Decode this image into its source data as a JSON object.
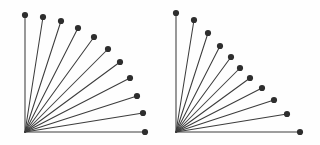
{
  "figure": {
    "background_color": "#fefefe",
    "line_color": "#3c3c3c",
    "dot_color": "#2e2e2e",
    "panel_count": 2,
    "panel_labels": [
      "left-fan",
      "right-fan"
    ]
  },
  "chart_data": {
    "type": "scatter",
    "subtitle": "",
    "xlabel": "",
    "ylabel": "",
    "grid": false,
    "legend": false,
    "axis_ticks": false,
    "tick_labels": [],
    "legend_entries": [],
    "annotations": [],
    "panels": [
      {
        "name": "left-fan",
        "description": "Eleven spokes radiating from a lower-left origin at equal angular spacing of 9 degrees, from 0 to 90 degrees, with nearly uniform radius forming a quarter circle of dots.",
        "origin": {
          "x": 25,
          "y": 132
        },
        "spoke_count": 11,
        "angle_start_deg": 0,
        "angle_end_deg": 90,
        "angle_step_deg": 9,
        "angles_deg": [
          0,
          9,
          18,
          27,
          36,
          45,
          54,
          63,
          72,
          81,
          90
        ],
        "radii": [
          120,
          119,
          118,
          118,
          118,
          118,
          117,
          117,
          117,
          118,
          117
        ],
        "endpoints": [
          {
            "x": 145,
            "y": 132
          },
          {
            "x": 143,
            "y": 113
          },
          {
            "x": 137,
            "y": 96
          },
          {
            "x": 130,
            "y": 78
          },
          {
            "x": 120,
            "y": 62
          },
          {
            "x": 108,
            "y": 49
          },
          {
            "x": 94,
            "y": 37
          },
          {
            "x": 78,
            "y": 28
          },
          {
            "x": 61,
            "y": 21
          },
          {
            "x": 43,
            "y": 17
          },
          {
            "x": 25,
            "y": 15
          }
        ],
        "dot_radius": 3.1
      },
      {
        "name": "right-fan",
        "description": "Eleven spokes radiating from a lower-left origin at equal angular spacing of 9 degrees, from 0 to 90 degrees, with radii that vary, longest at the horizontal and vertical extremes and shortest near the middle of the sweep.",
        "origin": {
          "x": 176,
          "y": 132
        },
        "spoke_count": 11,
        "angle_start_deg": 0,
        "angle_end_deg": 90,
        "angle_step_deg": 9,
        "angles_deg": [
          0,
          9,
          18,
          27,
          36,
          45,
          54,
          63,
          72,
          81,
          90
        ],
        "radii": [
          124,
          112,
          103,
          96,
          92,
          91,
          93,
          97,
          104,
          113,
          119
        ],
        "endpoints": [
          {
            "x": 300,
            "y": 132
          },
          {
            "x": 287,
            "y": 114
          },
          {
            "x": 274,
            "y": 100
          },
          {
            "x": 262,
            "y": 88
          },
          {
            "x": 250,
            "y": 78
          },
          {
            "x": 240,
            "y": 68
          },
          {
            "x": 231,
            "y": 57
          },
          {
            "x": 220,
            "y": 46
          },
          {
            "x": 208,
            "y": 33
          },
          {
            "x": 194,
            "y": 20
          },
          {
            "x": 176,
            "y": 13
          }
        ],
        "dot_radius": 3.1
      }
    ]
  }
}
